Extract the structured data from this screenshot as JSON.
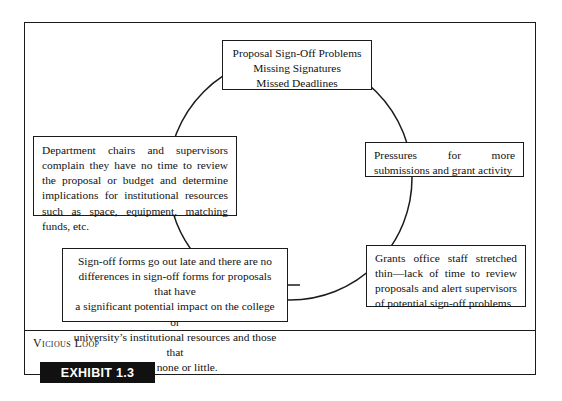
{
  "exhibit": {
    "caption": "Vicious Loop",
    "tag_label": "EXHIBIT 1.3"
  },
  "diagram": {
    "type": "cycle-loop",
    "shape": "circle",
    "nodes": {
      "top": {
        "id": "proposal-sign-off-problems",
        "align": "center",
        "lines": [
          "Proposal Sign-Off Problems",
          "Missing Signatures",
          "Missed Deadlines"
        ]
      },
      "right": {
        "id": "pressures-for-more-submissions",
        "align": "justify",
        "text": "Pressures for more submissions and grant activity"
      },
      "bottom_right": {
        "id": "grants-office-staff-stretched-thin",
        "align": "justify",
        "text": "Grants office staff stretched thin—lack of time to review proposals and alert supervisors of potential sign-off problems"
      },
      "bottom_center": {
        "id": "sign-off-forms-go-out-late",
        "align": "center",
        "lines": [
          "Sign-off forms go out late and there are no",
          "differences in sign-off forms for proposals that have",
          "a significant  potential impact on the college or",
          "university’s institutional resources and those that",
          "have none or little."
        ]
      },
      "left": {
        "id": "department-chairs-and-supervisors-complain",
        "align": "justify",
        "text": "Department chairs and supervisors complain they have no time to review the proposal or budget and determine implications for institutional resources such as space, equipment, matching funds, etc."
      }
    }
  },
  "colors": {
    "ink": "#1b1b1b",
    "page": "#ffffff",
    "tag_background": "#111111",
    "tag_text": "#ffffff"
  }
}
